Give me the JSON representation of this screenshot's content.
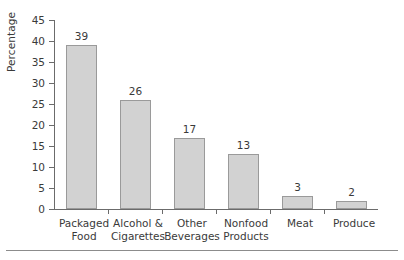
{
  "chart_data": {
    "type": "bar",
    "title": "",
    "xlabel": "",
    "ylabel": "Percentage",
    "ylim": [
      0,
      45
    ],
    "ytick_step": 5,
    "yticks": [
      0,
      5,
      10,
      15,
      20,
      25,
      30,
      35,
      40,
      45
    ],
    "ytick_labels": [
      "0",
      "5",
      "10",
      "15",
      "20",
      "25",
      "30",
      "35",
      "40",
      "45"
    ],
    "grid": false,
    "legend": false,
    "categories": [
      "Packaged Food",
      "Alcohol & Cigarettes",
      "Other Beverages",
      "Nonfood Products",
      "Meat",
      "Produce"
    ],
    "category_lines": [
      [
        "Packaged",
        "Food"
      ],
      [
        "Alcohol &",
        "Cigarettes"
      ],
      [
        "Other",
        "Beverages"
      ],
      [
        "Nonfood",
        "Products"
      ],
      [
        "Meat",
        ""
      ],
      [
        "Produce",
        ""
      ]
    ],
    "values": [
      39,
      26,
      17,
      13,
      3,
      2
    ],
    "value_labels": [
      "39",
      "26",
      "17",
      "13",
      "3",
      "2"
    ],
    "colors": {
      "bar_fill": "#d2d2d2",
      "bar_border": "#9a9a9a",
      "axis": "#6b6b6b",
      "text": "#3a3a3a",
      "background": "#ffffff",
      "rule": "#8c8c8c"
    }
  }
}
